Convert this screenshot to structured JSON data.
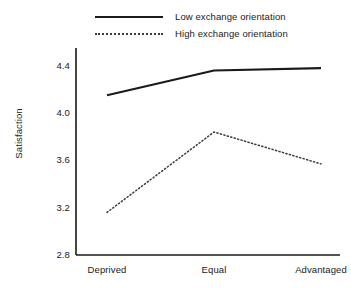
{
  "chart_data": {
    "type": "line",
    "title": "",
    "xlabel": "",
    "ylabel": "Satisfaction",
    "categories": [
      "Deprived",
      "Equal",
      "Advantaged"
    ],
    "ylim": [
      2.8,
      4.55
    ],
    "yticks": [
      "2.8",
      "3.2",
      "3.6",
      "4.0",
      "4.4"
    ],
    "ytick_values": [
      2.8,
      3.2,
      3.6,
      4.0,
      4.4
    ],
    "grid": false,
    "legend_position": "top",
    "series": [
      {
        "name": "Low exchange orientation",
        "style": "solid",
        "color": "#1a1a1a",
        "values": [
          4.15,
          4.36,
          4.38
        ]
      },
      {
        "name": "High exchange orientation",
        "style": "dotted",
        "color": "#3a3a3a",
        "values": [
          3.16,
          3.84,
          3.57
        ]
      }
    ]
  },
  "legend": {
    "items": [
      {
        "label": "Low exchange orientation",
        "style": "solid"
      },
      {
        "label": "High exchange orientation",
        "style": "dotted"
      }
    ]
  },
  "axes": {
    "y_title": "Satisfaction",
    "y_ticks": [
      "4.4",
      "4.0",
      "3.6",
      "3.2",
      "2.8"
    ],
    "x_ticks": [
      "Deprived",
      "Equal",
      "Advantaged"
    ]
  },
  "colors": {
    "axis": "#1a1a1a",
    "series_low": "#1a1a1a",
    "series_high": "#3a3a3a",
    "background": "#ffffff"
  }
}
